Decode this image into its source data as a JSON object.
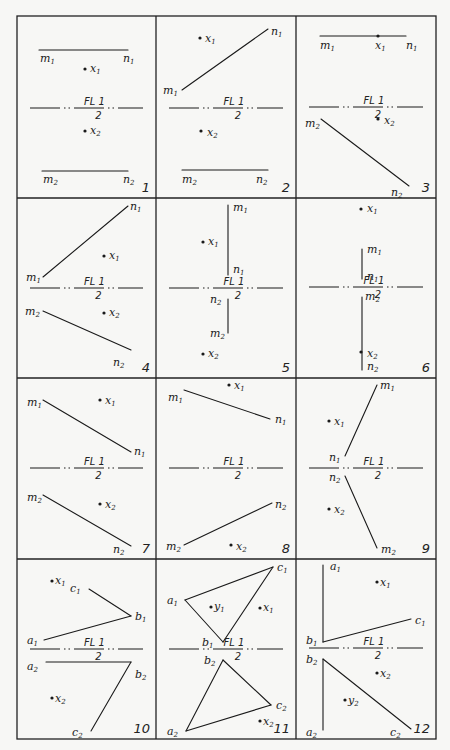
{
  "figure": {
    "width": 450,
    "height": 750,
    "grid": {
      "cols": [
        17,
        156,
        296,
        436
      ],
      "rows": [
        16,
        198,
        378,
        559,
        739
      ]
    },
    "fold_line_label": {
      "top": "FL 1",
      "bottom": "2"
    },
    "panels": [
      {
        "number": "1",
        "fold_line_y": 108,
        "segments": [
          [
            39,
            50,
            128,
            50
          ],
          [
            42,
            171,
            128,
            171
          ]
        ],
        "points": [
          {
            "name": "x1",
            "x": 85,
            "y": 69
          },
          {
            "name": "x2",
            "x": 85,
            "y": 131
          }
        ],
        "labels": [
          {
            "t": "m",
            "s": "1",
            "x": 40,
            "y": 62
          },
          {
            "t": "n",
            "s": "1",
            "x": 123,
            "y": 62
          },
          {
            "t": "x",
            "s": "1",
            "x": 90,
            "y": 72
          },
          {
            "t": "x",
            "s": "2",
            "x": 90,
            "y": 134
          },
          {
            "t": "m",
            "s": "2",
            "x": 43,
            "y": 183
          },
          {
            "t": "n",
            "s": "2",
            "x": 123,
            "y": 183
          }
        ]
      },
      {
        "number": "2",
        "fold_line_y": 108,
        "segments": [
          [
            182,
            90,
            268,
            29
          ],
          [
            182,
            170,
            268,
            170
          ]
        ],
        "points": [
          {
            "name": "x1",
            "x": 200,
            "y": 38
          },
          {
            "name": "x2",
            "x": 201,
            "y": 131
          }
        ],
        "labels": [
          {
            "t": "x",
            "s": "1",
            "x": 205,
            "y": 42
          },
          {
            "t": "n",
            "s": "1",
            "x": 271,
            "y": 35
          },
          {
            "t": "m",
            "s": "1",
            "x": 163,
            "y": 94
          },
          {
            "t": "x",
            "s": "2",
            "x": 207,
            "y": 136
          },
          {
            "t": "m",
            "s": "2",
            "x": 182,
            "y": 183
          },
          {
            "t": "n",
            "s": "2",
            "x": 256,
            "y": 183
          }
        ]
      },
      {
        "number": "3",
        "fold_line_y": 107,
        "segments": [
          [
            320,
            36,
            406,
            36
          ],
          [
            321,
            119,
            409,
            186
          ]
        ],
        "points": [
          {
            "name": "x1",
            "x": 378,
            "y": 36
          },
          {
            "name": "x2",
            "x": 378,
            "y": 119
          }
        ],
        "labels": [
          {
            "t": "m",
            "s": "1",
            "x": 320,
            "y": 49
          },
          {
            "t": "x",
            "s": "1",
            "x": 375,
            "y": 49
          },
          {
            "t": "n",
            "s": "1",
            "x": 406,
            "y": 49
          },
          {
            "t": "m",
            "s": "2",
            "x": 305,
            "y": 127
          },
          {
            "t": "x",
            "s": "2",
            "x": 384,
            "y": 124
          },
          {
            "t": "n",
            "s": "2",
            "x": 391,
            "y": 196
          }
        ]
      },
      {
        "number": "4",
        "fold_line_y": 288,
        "segments": [
          [
            43,
            277,
            128,
            206
          ],
          [
            43,
            311,
            131,
            350
          ]
        ],
        "points": [
          {
            "name": "x1",
            "x": 104,
            "y": 256
          },
          {
            "name": "x2",
            "x": 104,
            "y": 313
          }
        ],
        "labels": [
          {
            "t": "n",
            "s": "1",
            "x": 130,
            "y": 210
          },
          {
            "t": "x",
            "s": "1",
            "x": 109,
            "y": 259
          },
          {
            "t": "m",
            "s": "1",
            "x": 26,
            "y": 281
          },
          {
            "t": "m",
            "s": "2",
            "x": 25,
            "y": 315
          },
          {
            "t": "x",
            "s": "2",
            "x": 109,
            "y": 316
          },
          {
            "t": "n",
            "s": "2",
            "x": 113,
            "y": 366
          }
        ]
      },
      {
        "number": "5",
        "fold_line_y": 288,
        "segments": [
          [
            228,
            205,
            228,
            275
          ],
          [
            228,
            299,
            228,
            333
          ]
        ],
        "points": [
          {
            "name": "x1",
            "x": 203,
            "y": 242
          },
          {
            "name": "x2",
            "x": 203,
            "y": 354
          }
        ],
        "labels": [
          {
            "t": "m",
            "s": "1",
            "x": 233,
            "y": 211
          },
          {
            "t": "x",
            "s": "1",
            "x": 208,
            "y": 245
          },
          {
            "t": "n",
            "s": "1",
            "x": 233,
            "y": 273
          },
          {
            "t": "n",
            "s": "2",
            "x": 210,
            "y": 303
          },
          {
            "t": "m",
            "s": "2",
            "x": 210,
            "y": 337
          },
          {
            "t": "x",
            "s": "2",
            "x": 208,
            "y": 357
          }
        ]
      },
      {
        "number": "6",
        "fold_line_y": 287,
        "segments": [
          [
            362,
            249,
            362,
            279
          ],
          [
            362,
            297,
            362,
            370
          ]
        ],
        "points": [
          {
            "name": "x1",
            "x": 361,
            "y": 209
          },
          {
            "name": "x2",
            "x": 361,
            "y": 352
          }
        ],
        "labels": [
          {
            "t": "x",
            "s": "1",
            "x": 367,
            "y": 212
          },
          {
            "t": "m",
            "s": "1",
            "x": 367,
            "y": 253
          },
          {
            "t": "n",
            "s": "1",
            "x": 367,
            "y": 280
          },
          {
            "t": "m",
            "s": "2",
            "x": 365,
            "y": 300
          },
          {
            "t": "x",
            "s": "2",
            "x": 367,
            "y": 357
          },
          {
            "t": "n",
            "s": "2",
            "x": 367,
            "y": 370
          }
        ]
      },
      {
        "number": "7",
        "fold_line_y": 468,
        "segments": [
          [
            43,
            400,
            131,
            452
          ],
          [
            43,
            495,
            131,
            546
          ]
        ],
        "points": [
          {
            "name": "x1",
            "x": 100,
            "y": 400
          },
          {
            "name": "x2",
            "x": 100,
            "y": 504
          }
        ],
        "labels": [
          {
            "t": "m",
            "s": "1",
            "x": 27,
            "y": 406
          },
          {
            "t": "x",
            "s": "1",
            "x": 105,
            "y": 404
          },
          {
            "t": "n",
            "s": "1",
            "x": 134,
            "y": 455
          },
          {
            "t": "m",
            "s": "2",
            "x": 27,
            "y": 501
          },
          {
            "t": "x",
            "s": "2",
            "x": 105,
            "y": 508
          },
          {
            "t": "n",
            "s": "2",
            "x": 113,
            "y": 553
          }
        ]
      },
      {
        "number": "8",
        "fold_line_y": 468,
        "segments": [
          [
            184,
            390,
            270,
            419
          ],
          [
            184,
            545,
            272,
            503
          ]
        ],
        "points": [
          {
            "name": "x1",
            "x": 229,
            "y": 385
          },
          {
            "name": "x2",
            "x": 231,
            "y": 545
          }
        ],
        "labels": [
          {
            "t": "x",
            "s": "1",
            "x": 234,
            "y": 389
          },
          {
            "t": "m",
            "s": "1",
            "x": 168,
            "y": 401
          },
          {
            "t": "n",
            "s": "1",
            "x": 275,
            "y": 423
          },
          {
            "t": "n",
            "s": "2",
            "x": 275,
            "y": 508
          },
          {
            "t": "m",
            "s": "2",
            "x": 166,
            "y": 550
          },
          {
            "t": "x",
            "s": "2",
            "x": 236,
            "y": 550
          }
        ]
      },
      {
        "number": "9",
        "fold_line_y": 468,
        "segments": [
          [
            345,
            456,
            377,
            385
          ],
          [
            345,
            476,
            377,
            548
          ]
        ],
        "points": [
          {
            "name": "x1",
            "x": 329,
            "y": 421
          },
          {
            "name": "x2",
            "x": 329,
            "y": 509
          }
        ],
        "labels": [
          {
            "t": "m",
            "s": "1",
            "x": 380,
            "y": 389
          },
          {
            "t": "x",
            "s": "1",
            "x": 334,
            "y": 425
          },
          {
            "t": "n",
            "s": "1",
            "x": 329,
            "y": 461
          },
          {
            "t": "n",
            "s": "2",
            "x": 329,
            "y": 481
          },
          {
            "t": "x",
            "s": "2",
            "x": 334,
            "y": 513
          },
          {
            "t": "m",
            "s": "2",
            "x": 381,
            "y": 553
          }
        ]
      },
      {
        "number": "10",
        "fold_line_y": 649,
        "segments": [
          [
            44,
            640,
            131,
            616
          ],
          [
            89,
            589,
            131,
            616
          ],
          [
            46,
            662,
            131,
            662
          ],
          [
            131,
            662,
            91,
            731
          ]
        ],
        "points": [
          {
            "name": "x1",
            "x": 52,
            "y": 581
          },
          {
            "name": "x2",
            "x": 52,
            "y": 698
          }
        ],
        "labels": [
          {
            "t": "x",
            "s": "1",
            "x": 55,
            "y": 584
          },
          {
            "t": "c",
            "s": "1",
            "x": 70,
            "y": 592
          },
          {
            "t": "b",
            "s": "1",
            "x": 135,
            "y": 620
          },
          {
            "t": "a",
            "s": "1",
            "x": 27,
            "y": 644
          },
          {
            "t": "a",
            "s": "2",
            "x": 27,
            "y": 670
          },
          {
            "t": "b",
            "s": "2",
            "x": 135,
            "y": 678
          },
          {
            "t": "x",
            "s": "2",
            "x": 55,
            "y": 702
          },
          {
            "t": "c",
            "s": "2",
            "x": 72,
            "y": 736
          }
        ]
      },
      {
        "number": "11",
        "fold_line_y": 649,
        "segments": [
          [
            185,
            600,
            273,
            567
          ],
          [
            273,
            567,
            223,
            642
          ],
          [
            223,
            642,
            185,
            600
          ],
          [
            223,
            660,
            271,
            705
          ],
          [
            271,
            705,
            186,
            731
          ],
          [
            186,
            731,
            223,
            660
          ]
        ],
        "points": [
          {
            "name": "y1",
            "x": 211,
            "y": 607
          },
          {
            "name": "x1",
            "x": 260,
            "y": 608
          },
          {
            "name": "x2",
            "x": 260,
            "y": 721
          }
        ],
        "labels": [
          {
            "t": "c",
            "s": "1",
            "x": 277,
            "y": 571
          },
          {
            "t": "a",
            "s": "1",
            "x": 167,
            "y": 604
          },
          {
            "t": "y",
            "s": "1",
            "x": 214,
            "y": 610
          },
          {
            "t": "x",
            "s": "1",
            "x": 263,
            "y": 611
          },
          {
            "t": "b",
            "s": "1",
            "x": 202,
            "y": 646
          },
          {
            "t": "b",
            "s": "2",
            "x": 204,
            "y": 664
          },
          {
            "t": "c",
            "s": "2",
            "x": 276,
            "y": 709
          },
          {
            "t": "x",
            "s": "2",
            "x": 263,
            "y": 725
          },
          {
            "t": "a",
            "s": "2",
            "x": 167,
            "y": 735
          }
        ]
      },
      {
        "number": "12",
        "fold_line_y": 648,
        "segments": [
          [
            323,
            565,
            323,
            642
          ],
          [
            323,
            642,
            411,
            619
          ],
          [
            323,
            659,
            323,
            730
          ],
          [
            323,
            659,
            411,
            729
          ]
        ],
        "points": [
          {
            "name": "x1",
            "x": 377,
            "y": 582
          },
          {
            "name": "x2",
            "x": 377,
            "y": 673
          },
          {
            "name": "y2",
            "x": 345,
            "y": 700
          }
        ],
        "labels": [
          {
            "t": "a",
            "s": "1",
            "x": 330,
            "y": 570
          },
          {
            "t": "x",
            "s": "1",
            "x": 380,
            "y": 586
          },
          {
            "t": "c",
            "s": "1",
            "x": 415,
            "y": 624
          },
          {
            "t": "b",
            "s": "1",
            "x": 306,
            "y": 644
          },
          {
            "t": "b",
            "s": "2",
            "x": 306,
            "y": 663
          },
          {
            "t": "x",
            "s": "2",
            "x": 380,
            "y": 677
          },
          {
            "t": "y",
            "s": "2",
            "x": 348,
            "y": 704
          },
          {
            "t": "a",
            "s": "2",
            "x": 306,
            "y": 736
          },
          {
            "t": "c",
            "s": "2",
            "x": 390,
            "y": 736
          }
        ]
      }
    ]
  }
}
